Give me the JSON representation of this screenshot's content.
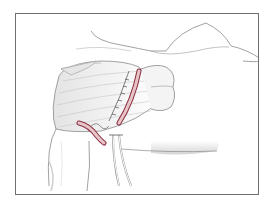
{
  "illustration": {
    "subject": "surgical illustration of shoulder/chest region with incisions and drains",
    "elements": [
      "breast-contour",
      "muscle-flap",
      "upper-incision",
      "lower-incision",
      "suture-line",
      "drain-tubes",
      "arm"
    ]
  },
  "colors": {
    "frame": "#6e6e6e",
    "background": "#ffffff",
    "outline": "#8a8a8a",
    "shading": "#d6d6d6",
    "incision_fill": "#e8c4c8",
    "incision_edge": "#8a3040",
    "suture": "#333333"
  }
}
